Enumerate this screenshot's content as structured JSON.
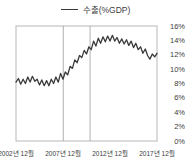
{
  "legend": {
    "label": "수출(%GDP)"
  },
  "colors": {
    "line": "#3a3a3a",
    "plot_border": "#b8b8b8",
    "ref_line": "#a8a8a8",
    "text": "#3c3c3c",
    "background": "#ffffff"
  },
  "chart_data": {
    "type": "line",
    "title": "",
    "xlabel": "",
    "ylabel": "",
    "legend_entries": [
      "수출(%GDP)"
    ],
    "legend_position": "top-center",
    "grid": "outer box only, no horizontal gridlines, two vertical reference lines",
    "x_tick_labels": [
      "2002년 12월",
      "2007년 12월",
      "2012년 12월",
      "2017년 12월"
    ],
    "x_tick_values": [
      2002.92,
      2007.92,
      2012.92,
      2017.92
    ],
    "x_range": [
      2002.92,
      2017.92
    ],
    "y_ticks": [
      "0%",
      "2%",
      "4%",
      "6%",
      "8%",
      "10%",
      "12%",
      "14%",
      "16%"
    ],
    "y_tick_values": [
      0,
      2,
      4,
      6,
      8,
      10,
      12,
      14,
      16
    ],
    "ylim": [
      0,
      16
    ],
    "reference_lines_x": [
      2007.95,
      2010.8
    ],
    "series": [
      {
        "name": "수출(%GDP)",
        "x": [
          2002.92,
          2003.17,
          2003.42,
          2003.67,
          2003.92,
          2004.17,
          2004.42,
          2004.67,
          2004.92,
          2005.17,
          2005.42,
          2005.67,
          2005.92,
          2006.17,
          2006.42,
          2006.67,
          2006.92,
          2007.17,
          2007.42,
          2007.67,
          2007.92,
          2008.17,
          2008.42,
          2008.67,
          2008.92,
          2009.17,
          2009.42,
          2009.67,
          2009.92,
          2010.17,
          2010.42,
          2010.67,
          2010.92,
          2011.17,
          2011.42,
          2011.67,
          2011.92,
          2012.17,
          2012.42,
          2012.67,
          2012.92,
          2013.17,
          2013.42,
          2013.67,
          2013.92,
          2014.17,
          2014.42,
          2014.67,
          2014.92,
          2015.17,
          2015.42,
          2015.67,
          2015.92,
          2016.17,
          2016.42,
          2016.67,
          2016.92,
          2017.17,
          2017.42,
          2017.67,
          2017.92
        ],
        "values": [
          8.2,
          8.7,
          7.9,
          8.6,
          8.0,
          8.9,
          8.2,
          9.0,
          8.3,
          8.6,
          7.8,
          8.5,
          7.7,
          8.4,
          7.7,
          8.6,
          8.0,
          8.9,
          8.2,
          9.4,
          8.6,
          9.6,
          9.2,
          10.4,
          10.1,
          11.3,
          10.9,
          11.9,
          11.6,
          12.6,
          12.1,
          13.1,
          12.7,
          13.9,
          13.2,
          14.3,
          13.6,
          14.5,
          13.8,
          14.6,
          13.9,
          14.7,
          13.9,
          14.4,
          13.6,
          14.2,
          13.5,
          14.1,
          13.3,
          13.9,
          13.0,
          13.6,
          12.7,
          13.1,
          12.2,
          12.8,
          11.9,
          11.4,
          12.1,
          11.7,
          12.2
        ]
      }
    ]
  }
}
